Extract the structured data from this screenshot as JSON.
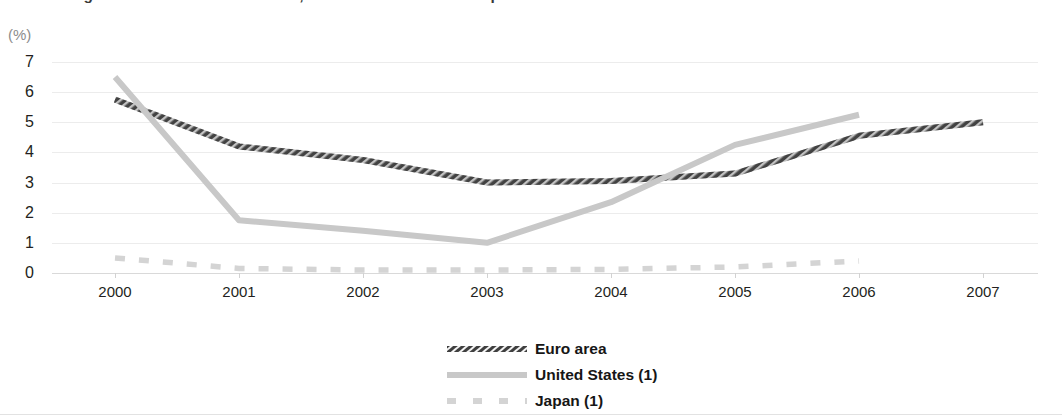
{
  "header": {
    "title": "Real GDP growth rates in the euro area, the United States and Japan",
    "y_unit": "(%)"
  },
  "legend": {
    "position": "bottom-center",
    "items": [
      {
        "label": "Euro area",
        "color": "#4a4a4a",
        "style": "hatched"
      },
      {
        "label": "United States (1)",
        "color": "#c8c8c8",
        "style": "solid"
      },
      {
        "label": "Japan (1)",
        "color": "#d4d4d4",
        "style": "dashed"
      }
    ]
  },
  "chart_data": {
    "type": "line",
    "title": "Real GDP growth rates in the euro area, the United States and Japan",
    "xlabel": "",
    "ylabel": "(%)",
    "ylim": [
      0,
      7
    ],
    "yticks": [
      0,
      1,
      2,
      3,
      4,
      5,
      6,
      7
    ],
    "ytick_labels": [
      "0",
      "1",
      "2",
      "3",
      "4",
      "5",
      "6",
      "7"
    ],
    "grid": true,
    "categories": [
      "2000",
      "2001",
      "2002",
      "2003",
      "2004",
      "2005",
      "2006",
      "2007"
    ],
    "x": [
      2000,
      2001,
      2002,
      2003,
      2004,
      2005,
      2006,
      2007
    ],
    "series": [
      {
        "name": "Euro area",
        "color": "#4a4a4a",
        "style": "hatched",
        "values": [
          5.75,
          4.2,
          3.75,
          3.0,
          3.05,
          3.3,
          4.55,
          5.0
        ]
      },
      {
        "name": "United States (1)",
        "color": "#c8c8c8",
        "style": "solid",
        "values": [
          6.5,
          1.75,
          1.4,
          1.0,
          2.35,
          4.25,
          5.25,
          null
        ]
      },
      {
        "name": "Japan (1)",
        "color": "#d4d4d4",
        "style": "dashed",
        "values": [
          0.5,
          0.15,
          0.1,
          0.1,
          0.12,
          0.2,
          0.4,
          null
        ]
      }
    ]
  }
}
